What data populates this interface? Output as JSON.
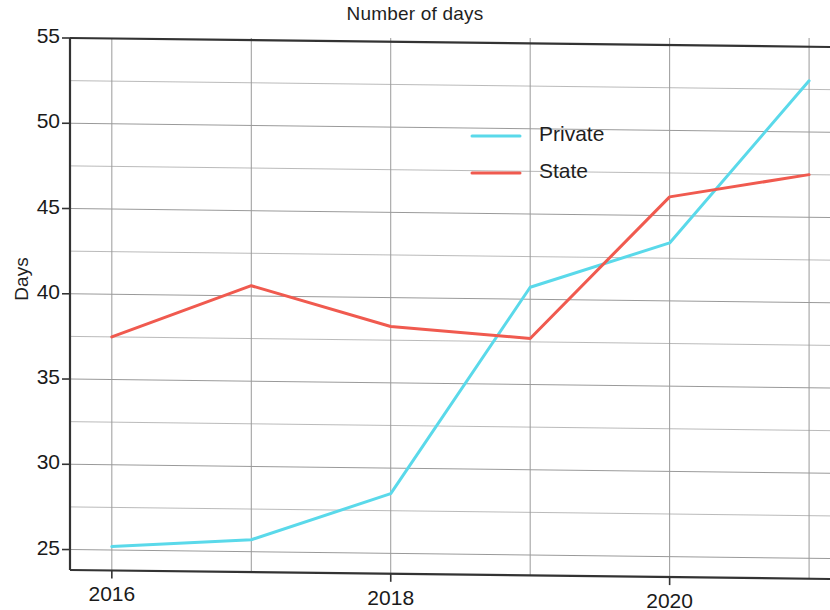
{
  "chart_data": {
    "type": "line",
    "title": "Number of days",
    "xlabel": "",
    "ylabel": "Days",
    "x": [
      2016,
      2017,
      2018,
      2019,
      2020,
      2021
    ],
    "xtick_labels": [
      "2016",
      "2018",
      "2020"
    ],
    "xtick_values": [
      2016,
      2018,
      2020
    ],
    "xminor_values": [
      2017,
      2019,
      2021
    ],
    "xlim": [
      2015.7,
      2021.15
    ],
    "ytick_labels": [
      "25",
      "30",
      "35",
      "40",
      "45",
      "50",
      "55"
    ],
    "ytick_values": [
      25,
      30,
      35,
      40,
      45,
      50,
      55
    ],
    "yminor_values": [
      27.5,
      32.5,
      37.5,
      42.5,
      47.5,
      52.5
    ],
    "ylim": [
      23.8,
      55.0
    ],
    "grid": true,
    "legend_position": "upper center",
    "series": [
      {
        "name": "Private",
        "color": "#5ad9ea",
        "values": [
          25.2,
          25.7,
          28.5,
          40.7,
          43.4,
          53.0
        ]
      },
      {
        "name": "State",
        "color": "#f05a4f",
        "values": [
          37.5,
          40.6,
          38.3,
          37.7,
          46.1,
          47.5
        ]
      }
    ]
  },
  "figure": {
    "background_color": "#ffffff",
    "axis_color": "#333333",
    "grid_color": "#9a9a9a"
  }
}
